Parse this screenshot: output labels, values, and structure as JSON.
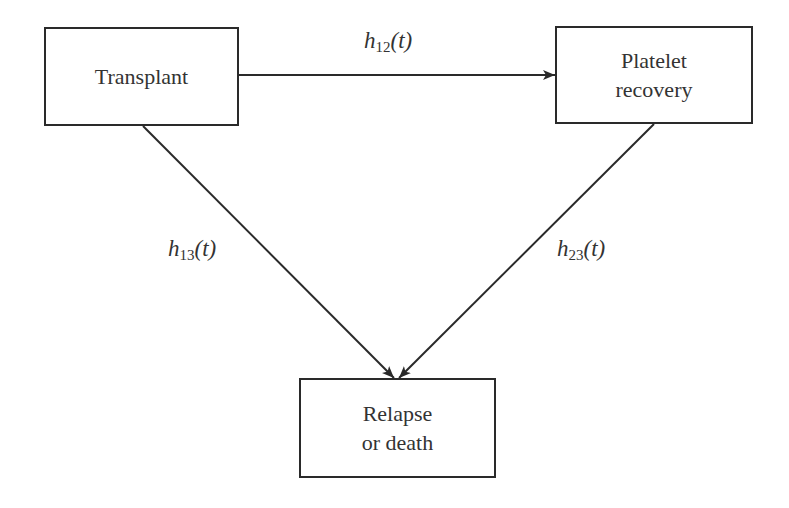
{
  "diagram": {
    "type": "multi-state model",
    "nodes": [
      {
        "id": "1",
        "lines": [
          "Transplant"
        ]
      },
      {
        "id": "2",
        "lines": [
          "Platelet",
          "recovery"
        ]
      },
      {
        "id": "3",
        "lines": [
          "Relapse",
          "or death"
        ]
      }
    ],
    "edges": [
      {
        "from": "1",
        "to": "2",
        "label": {
          "fn": "h",
          "sub": "12",
          "arg": "(t)"
        }
      },
      {
        "from": "1",
        "to": "3",
        "label": {
          "fn": "h",
          "sub": "13",
          "arg": "(t)"
        }
      },
      {
        "from": "2",
        "to": "3",
        "label": {
          "fn": "h",
          "sub": "23",
          "arg": "(t)"
        }
      }
    ],
    "colors": {
      "stroke": "#2a2a2a",
      "background": "#ffffff",
      "text": "#333333"
    }
  }
}
